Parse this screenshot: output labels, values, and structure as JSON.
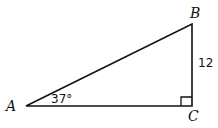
{
  "diagram": {
    "type": "right-triangle",
    "vertices": [
      {
        "name": "A",
        "x": 26,
        "y": 106
      },
      {
        "name": "B",
        "x": 192,
        "y": 24
      },
      {
        "name": "C",
        "x": 192,
        "y": 106
      }
    ],
    "labels": {
      "A": "A",
      "B": "B",
      "C": "C",
      "side_BC": "12",
      "angle_A": "37°"
    },
    "right_angle_at": "C",
    "stroke_color": "#111111",
    "background": "#ffffff"
  }
}
